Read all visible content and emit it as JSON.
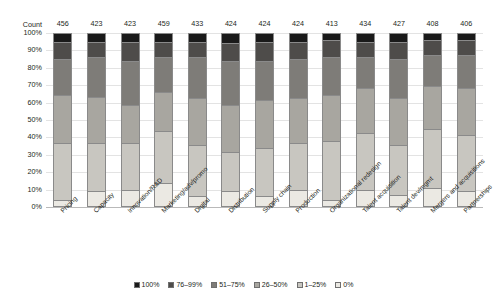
{
  "chart_data": {
    "type": "bar",
    "subtype": "stacked-percent",
    "title": "",
    "xlabel": "",
    "ylabel": "",
    "ylim": [
      0,
      100
    ],
    "grid": true,
    "legend_position": "bottom",
    "y_ticks": [
      "0%",
      "10%",
      "20%",
      "30%",
      "40%",
      "50%",
      "60%",
      "70%",
      "80%",
      "90%",
      "100%"
    ],
    "count_row_label": "Count",
    "counts": [
      456,
      423,
      423,
      459,
      433,
      424,
      424,
      424,
      413,
      434,
      427,
      408,
      406
    ],
    "categories": [
      "Pricing",
      "Capacity",
      "Innovation/R&D",
      "Marketing/adv/promo",
      "Digital",
      "Distribution",
      "Supply chain",
      "Production",
      "Organizational redesign",
      "Talent acquisition",
      "Talent dev/mgmt",
      "Mergers and acquisitions",
      "Partnerships"
    ],
    "series": [
      {
        "name": "0%",
        "color": "#ebe9e3",
        "values": [
          3,
          8,
          9,
          13,
          5,
          8,
          5,
          9,
          3,
          9,
          6,
          10,
          8
        ]
      },
      {
        "name": "1–25%",
        "color": "#c8c6c0",
        "values": [
          33,
          28,
          27,
          30,
          30,
          23,
          28,
          27,
          34,
          33,
          29,
          34,
          33
        ]
      },
      {
        "name": "26–50%",
        "color": "#a8a6a0",
        "values": [
          28,
          27,
          22,
          23,
          27,
          27,
          28,
          26,
          27,
          26,
          27,
          25,
          27
        ]
      },
      {
        "name": "51–75%",
        "color": "#7e7c78",
        "values": [
          21,
          23,
          26,
          20,
          24,
          26,
          23,
          23,
          22,
          18,
          23,
          18,
          19
        ]
      },
      {
        "name": "76–99%",
        "color": "#4e4c4a",
        "values": [
          10,
          9,
          11,
          9,
          9,
          10,
          11,
          10,
          10,
          9,
          10,
          9,
          9
        ]
      },
      {
        "name": "100%",
        "color": "#1a1a1a",
        "values": [
          5,
          5,
          5,
          5,
          5,
          6,
          5,
          5,
          4,
          5,
          5,
          4,
          4
        ]
      }
    ],
    "legend": [
      {
        "label": "100%",
        "color": "#1a1a1a"
      },
      {
        "label": "76–99%",
        "color": "#4e4c4a"
      },
      {
        "label": "51–75%",
        "color": "#7e7c78"
      },
      {
        "label": "26–50%",
        "color": "#a8a6a0"
      },
      {
        "label": "1–25%",
        "color": "#c8c6c0"
      },
      {
        "label": "0%",
        "color": "#ebe9e3"
      }
    ]
  }
}
